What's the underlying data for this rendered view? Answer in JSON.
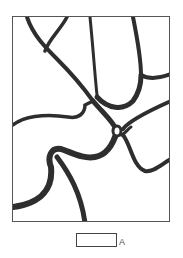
{
  "figure": {
    "stroke_color": "#2e2e2e",
    "border_color": "#555555"
  },
  "scale_bar": {
    "label": "A"
  }
}
